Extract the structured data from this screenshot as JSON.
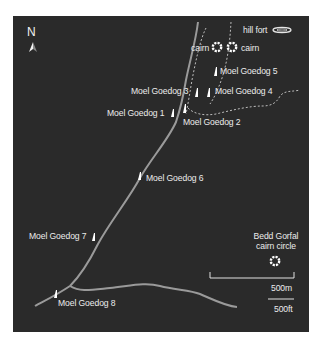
{
  "map": {
    "background_color": "#2a2a2a",
    "road_color": "#9a9a9a",
    "path_color": "#bdbdbd",
    "marker_color": "#ffffff",
    "north_label": "N",
    "compass_icon": "north-arrow-icon",
    "features": {
      "hill_fort": {
        "label": "hill fort",
        "icon": "hill-fort-icon"
      },
      "cairn_west": {
        "label": "cairn",
        "icon": "cairn-icon"
      },
      "cairn_east": {
        "label": "cairn",
        "icon": "cairn-icon"
      },
      "bedd_gorfal": {
        "label_line1": "Bedd Gorfal",
        "label_line2": "cairn circle",
        "icon": "cairn-circle-icon"
      }
    },
    "stones": [
      {
        "label": "Moel Goedog 1",
        "icon": "standing-stone-icon"
      },
      {
        "label": "Moel Goedog 2",
        "icon": "standing-stone-icon"
      },
      {
        "label": "Moel Goedog 3",
        "icon": "standing-stone-icon"
      },
      {
        "label": "Moel Goedog 4",
        "icon": "standing-stone-icon"
      },
      {
        "label": "Moel Goedog 5",
        "icon": "standing-stone-icon"
      },
      {
        "label": "Moel Goedog 6",
        "icon": "standing-stone-icon"
      },
      {
        "label": "Moel Goedog 7",
        "icon": "standing-stone-icon"
      },
      {
        "label": "Moel Goedog 8",
        "icon": "standing-stone-icon"
      }
    ],
    "scale": {
      "metric_label": "500m",
      "imperial_label": "500ft"
    }
  }
}
